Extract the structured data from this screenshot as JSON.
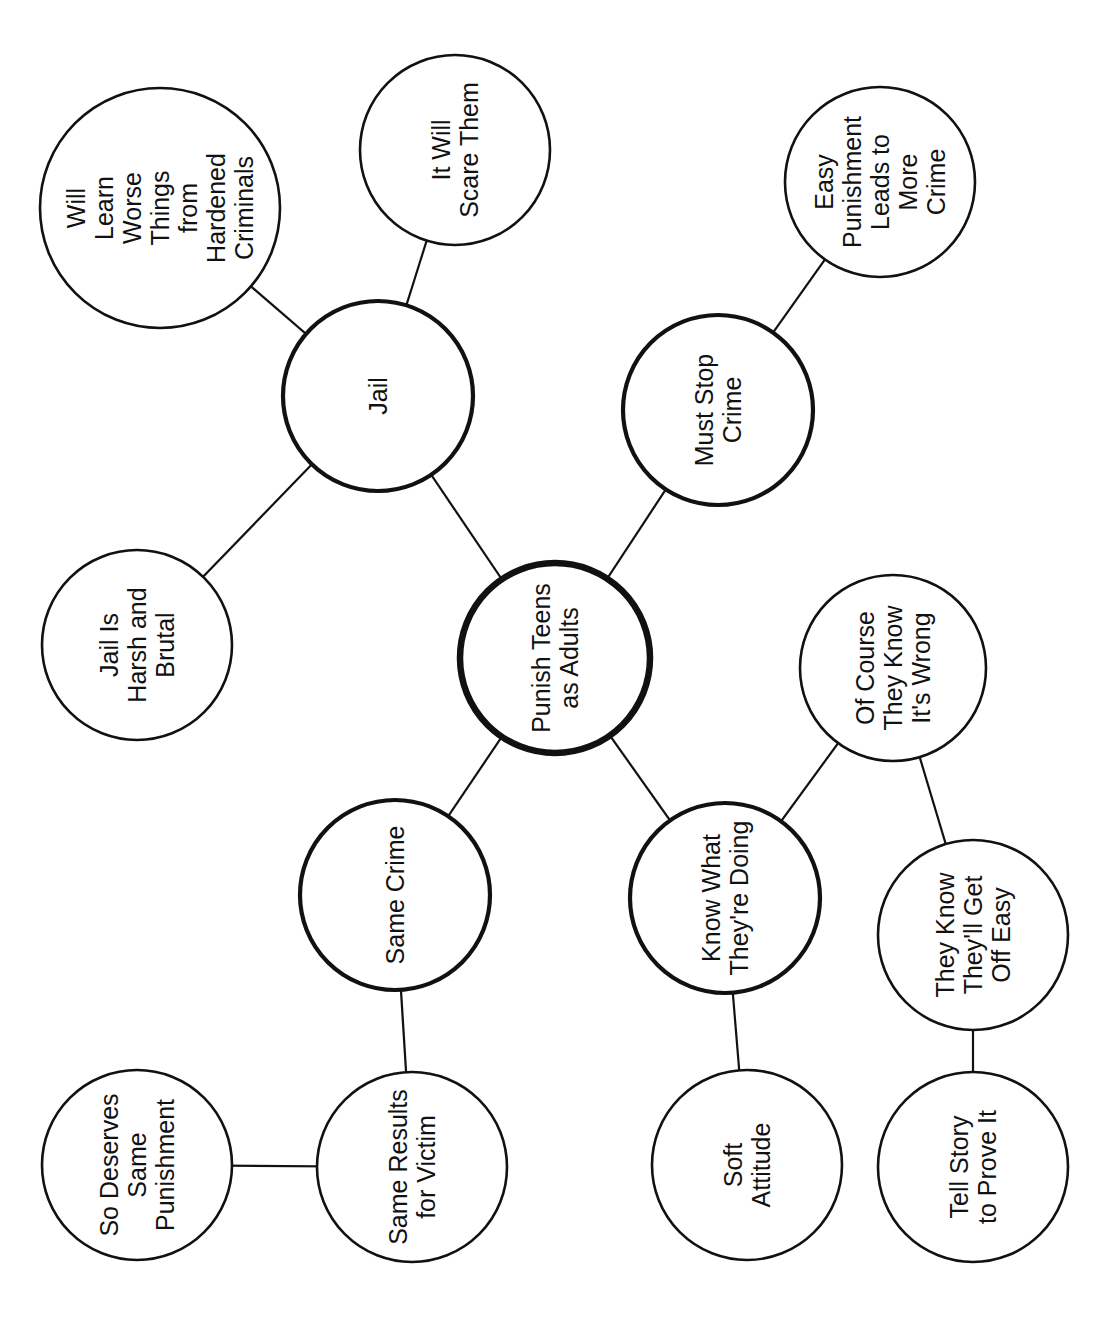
{
  "diagram": {
    "type": "web / cluster map",
    "orientation": "rotated 90 degrees counter-clockwise",
    "center": {
      "id": "center",
      "label_lines": [
        "Punish Teens",
        "as Adults"
      ]
    },
    "nodes": [
      {
        "id": "center",
        "level": 0,
        "cx": 555,
        "cy": 658,
        "r": 95,
        "lines": [
          "Punish Teens",
          "as Adults"
        ]
      },
      {
        "id": "jail",
        "level": 1,
        "cx": 378,
        "cy": 396,
        "r": 95,
        "lines": [
          "Jail"
        ]
      },
      {
        "id": "must-stop-crime",
        "level": 1,
        "cx": 718,
        "cy": 410,
        "r": 95,
        "lines": [
          "Must Stop",
          "Crime"
        ]
      },
      {
        "id": "same-crime",
        "level": 1,
        "cx": 395,
        "cy": 895,
        "r": 95,
        "lines": [
          "Same Crime"
        ]
      },
      {
        "id": "know-what-theyre-doing",
        "level": 1,
        "cx": 725,
        "cy": 898,
        "r": 95,
        "lines": [
          "Know What",
          "They're Doing"
        ]
      },
      {
        "id": "will-learn-worse-things",
        "level": 2,
        "cx": 160,
        "cy": 208,
        "r": 120,
        "lines": [
          "Will",
          "Learn",
          "Worse",
          "Things",
          "from",
          "Hardened",
          "Criminals"
        ]
      },
      {
        "id": "it-will-scare-them",
        "level": 2,
        "cx": 455,
        "cy": 150,
        "r": 95,
        "lines": [
          "It Will",
          "Scare Them"
        ]
      },
      {
        "id": "jail-is-harsh",
        "level": 2,
        "cx": 137,
        "cy": 645,
        "r": 95,
        "lines": [
          "Jail Is",
          "Harsh and",
          "Brutal"
        ]
      },
      {
        "id": "easy-punishment",
        "level": 2,
        "cx": 880,
        "cy": 182,
        "r": 95,
        "lines": [
          "Easy",
          "Punishment",
          "Leads to",
          "More",
          "Crime"
        ]
      },
      {
        "id": "of-course-they-know",
        "level": 2,
        "cx": 893,
        "cy": 668,
        "r": 93,
        "lines": [
          "Of Course",
          "They Know",
          "It's Wrong"
        ]
      },
      {
        "id": "they-know-get-off-easy",
        "level": 2,
        "cx": 973,
        "cy": 935,
        "r": 95,
        "lines": [
          "They Know",
          "They'll Get",
          "Off Easy"
        ]
      },
      {
        "id": "tell-story",
        "level": 2,
        "cx": 973,
        "cy": 1167,
        "r": 95,
        "lines": [
          "Tell Story",
          "to Prove It"
        ]
      },
      {
        "id": "soft-attitude",
        "level": 2,
        "cx": 747,
        "cy": 1165,
        "r": 95,
        "lines": [
          "Soft",
          "Attitude"
        ]
      },
      {
        "id": "same-results-for-victim",
        "level": 2,
        "cx": 412,
        "cy": 1167,
        "r": 95,
        "lines": [
          "Same Results",
          "for Victim"
        ]
      },
      {
        "id": "so-deserves-same-punishment",
        "level": 2,
        "cx": 137,
        "cy": 1165,
        "r": 95,
        "lines": [
          "So Deserves",
          "Same",
          "Punishment"
        ]
      }
    ],
    "edges": [
      {
        "from": "center",
        "to": "jail"
      },
      {
        "from": "center",
        "to": "must-stop-crime"
      },
      {
        "from": "center",
        "to": "same-crime"
      },
      {
        "from": "center",
        "to": "know-what-theyre-doing"
      },
      {
        "from": "jail",
        "to": "will-learn-worse-things"
      },
      {
        "from": "jail",
        "to": "it-will-scare-them"
      },
      {
        "from": "jail",
        "to": "jail-is-harsh"
      },
      {
        "from": "must-stop-crime",
        "to": "easy-punishment"
      },
      {
        "from": "know-what-theyre-doing",
        "to": "of-course-they-know"
      },
      {
        "from": "know-what-theyre-doing",
        "to": "soft-attitude"
      },
      {
        "from": "of-course-they-know",
        "to": "they-know-get-off-easy"
      },
      {
        "from": "they-know-get-off-easy",
        "to": "tell-story"
      },
      {
        "from": "same-crime",
        "to": "same-results-for-victim"
      },
      {
        "from": "same-results-for-victim",
        "to": "so-deserves-same-punishment"
      }
    ],
    "colors": {
      "stroke": "#111111",
      "fill": "#ffffff",
      "text": "#111111",
      "background": "#ffffff"
    }
  }
}
